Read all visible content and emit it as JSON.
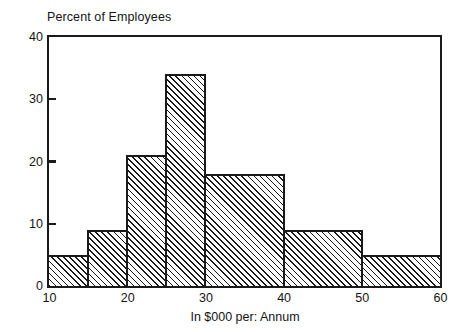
{
  "chart_data": {
    "type": "bar",
    "title": "Percent of Employees",
    "xlabel": "In $000 per: Annum",
    "ylabel": "Percent of Employees",
    "xlim": [
      10,
      60
    ],
    "ylim": [
      0,
      40
    ],
    "grid": false,
    "legend": false,
    "xticks": [
      10,
      20,
      30,
      40,
      50,
      60
    ],
    "xtick_labels": [
      "10",
      "20",
      "30",
      "40",
      "50",
      "60"
    ],
    "yticks": [
      0,
      10,
      20,
      30,
      40
    ],
    "ytick_labels": [
      "0",
      "10",
      "20",
      "30",
      "40"
    ],
    "bin_edges": [
      10,
      15,
      20,
      25,
      30,
      40,
      50,
      60
    ],
    "categories": [
      "10-15",
      "15-20",
      "20-25",
      "25-30",
      "30-40",
      "40-50",
      "50-60"
    ],
    "values": [
      5,
      9,
      21,
      34,
      18,
      9,
      5
    ],
    "bars": [
      {
        "start": 10,
        "end": 15,
        "value": 5
      },
      {
        "start": 15,
        "end": 20,
        "value": 9
      },
      {
        "start": 20,
        "end": 25,
        "value": 21
      },
      {
        "start": 25,
        "end": 30,
        "value": 34
      },
      {
        "start": 30,
        "end": 40,
        "value": 18
      },
      {
        "start": 40,
        "end": 50,
        "value": 9
      },
      {
        "start": 50,
        "end": 60,
        "value": 5
      }
    ],
    "fill": "diagonal-hatch",
    "color": "#1a1a1a"
  }
}
